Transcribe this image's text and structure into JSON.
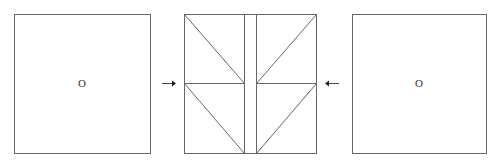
{
  "diagram": {
    "left_square": {
      "label": "O"
    },
    "middle_square": {
      "description": "folded square with central strip and diagonal creases"
    },
    "right_square": {
      "label": "O"
    },
    "arrows": [
      {
        "direction": "right",
        "position": "left-of-middle"
      },
      {
        "direction": "left",
        "position": "right-of-middle"
      }
    ],
    "colors": {
      "stroke": "#555555",
      "background": "#ffffff"
    }
  }
}
